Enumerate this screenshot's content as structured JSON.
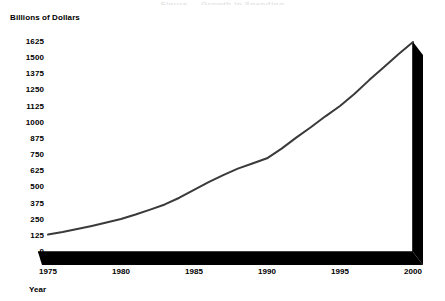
{
  "title_clipped": "Figure — Growth in Spending",
  "axes": {
    "ylabel": "Billions of Dollars",
    "xlabel": "Year",
    "yticks": [
      "1625",
      "1500",
      "1375",
      "1250",
      "1125",
      "1000",
      "875",
      "750",
      "625",
      "500",
      "375",
      "250",
      "125",
      "0"
    ],
    "xticks": [
      "1975",
      "1980",
      "1985",
      "1990",
      "1995",
      "2000"
    ]
  },
  "colors": {
    "line": "#3a3a3a",
    "axis": "#000000",
    "background": "#ffffff",
    "text": "#000000"
  },
  "chart_data": {
    "type": "line",
    "title": "",
    "xlabel": "Year",
    "ylabel": "Billions of Dollars",
    "xlim": [
      1975,
      2000
    ],
    "ylim": [
      0,
      1625
    ],
    "grid": false,
    "legend": "none",
    "x": [
      1975,
      1976,
      1977,
      1978,
      1979,
      1980,
      1981,
      1982,
      1983,
      1984,
      1985,
      1986,
      1987,
      1988,
      1989,
      1990,
      1991,
      1992,
      1993,
      1994,
      1995,
      1996,
      1997,
      1998,
      1999,
      2000
    ],
    "values": [
      135,
      155,
      178,
      202,
      228,
      255,
      290,
      328,
      368,
      420,
      480,
      540,
      595,
      645,
      685,
      725,
      800,
      885,
      965,
      1050,
      1130,
      1225,
      1330,
      1430,
      1530,
      1625
    ],
    "series": [
      {
        "name": "Spending",
        "values": [
          135,
          155,
          178,
          202,
          228,
          255,
          290,
          328,
          368,
          420,
          480,
          540,
          595,
          645,
          685,
          725,
          800,
          885,
          965,
          1050,
          1130,
          1225,
          1330,
          1430,
          1530,
          1625
        ]
      }
    ],
    "ytick_values": [
      1625,
      1500,
      1375,
      1250,
      1125,
      1000,
      875,
      750,
      625,
      500,
      375,
      250,
      125,
      0
    ],
    "xtick_values": [
      1975,
      1980,
      1985,
      1990,
      1995,
      2000
    ],
    "annotations": []
  }
}
